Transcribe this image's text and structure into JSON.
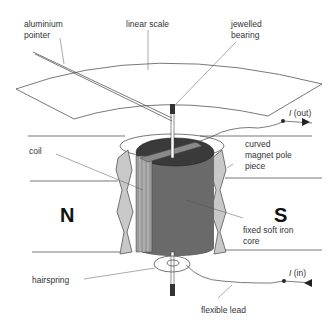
{
  "diagram": {
    "type": "moving-coil meter",
    "labels": {
      "aluminium_pointer_1": "aluminium",
      "aluminium_pointer_2": "pointer",
      "linear_scale": "linear scale",
      "jewelled_bearing_1": "jewelled",
      "jewelled_bearing_2": "bearing",
      "i_out_symbol": "I",
      "i_out_text": " (out)",
      "coil": "coil",
      "curved_pole_1": "curved",
      "curved_pole_2": "magnet pole",
      "curved_pole_3": "piece",
      "north": "N",
      "south": "S",
      "fixed_core_1": "fixed soft iron",
      "fixed_core_2": "core",
      "hairspring": "hairspring",
      "i_in_symbol": "I",
      "i_in_text": " (in)",
      "flexible_lead": "flexible lead"
    },
    "colors": {
      "line": "#444444",
      "core_dark": "#3a3a3a",
      "core_mid": "#6a6a6a",
      "pole_grey": "#c8c8c8",
      "coil_side": "#9a9a9a"
    }
  }
}
